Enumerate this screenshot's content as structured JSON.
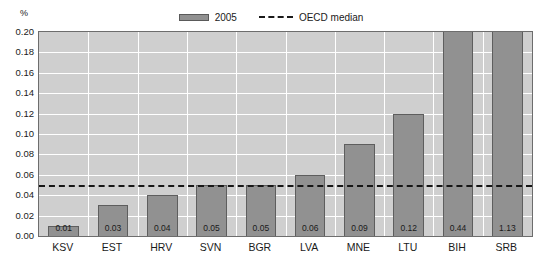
{
  "chart_data": {
    "type": "bar",
    "title": "",
    "subtitle": "",
    "unit_label": "%",
    "xlabel": "",
    "ylabel": "",
    "ylim": [
      0.0,
      0.2
    ],
    "ytick_step": 0.02,
    "grid": true,
    "legend_position": "top-center",
    "categories": [
      "KSV",
      "EST",
      "HRV",
      "SVN",
      "BGR",
      "LVA",
      "MNE",
      "LTU",
      "BIH",
      "SRB"
    ],
    "series": [
      {
        "name": "2005",
        "color": "#919191",
        "values": [
          0.01,
          0.03,
          0.04,
          0.05,
          0.05,
          0.06,
          0.09,
          0.12,
          0.44,
          1.13
        ],
        "labels": [
          "0.01",
          "0.03",
          "0.04",
          "0.05",
          "0.05",
          "0.06",
          "0.09",
          "0.12",
          "0.44",
          "1.13"
        ]
      }
    ],
    "reference_line": {
      "name": "OECD median",
      "value": 0.05,
      "style": "dashed",
      "color": "#161616"
    },
    "ytick_labels": [
      "0.20",
      "0.18",
      "0.16",
      "0.14",
      "0.12",
      "0.10",
      "0.08",
      "0.06",
      "0.04",
      "0.02",
      "0.00"
    ],
    "ytick_values": [
      0.2,
      0.18,
      0.16,
      0.14,
      0.12,
      0.1,
      0.08,
      0.06,
      0.04,
      0.02,
      0.0
    ],
    "note": "BIH and SRB bars exceed the 0.20 axis maximum and are clipped at the top of the plot area."
  },
  "legend": {
    "items": [
      {
        "label": "2005",
        "type": "bar",
        "color": "#919191"
      },
      {
        "label": "OECD median",
        "type": "dashed-line",
        "color": "#161616"
      }
    ]
  },
  "colors": {
    "bar_fill": "#919191",
    "bar_border": "#5e5e5e",
    "plot_background": "#cfcfcf",
    "gridline": "#ffffff",
    "axis_border": "#6d6d6d",
    "text": "#1a1a1a",
    "page_background": "#ffffff"
  }
}
